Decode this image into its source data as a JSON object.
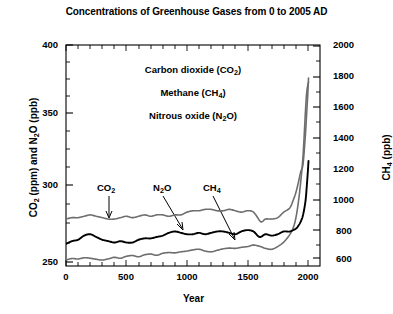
{
  "chart_data": {
    "type": "line",
    "title": "Concentrations of Greenhouse Gases from 0 to 2005 AD",
    "xlabel": "Year",
    "ylabel_left": "CO2 (ppm) and N2O (ppb)",
    "ylabel_right": "CH4 (ppb)",
    "xlim": [
      0,
      2100
    ],
    "ylim_left": [
      243,
      403
    ],
    "ylim_right": [
      560,
      2040
    ],
    "xticks": [
      0,
      500,
      1000,
      1500,
      2000
    ],
    "yticks_left": [
      250,
      300,
      350,
      400
    ],
    "yticks_right": [
      600,
      800,
      1000,
      1200,
      1400,
      1600,
      1800,
      2000
    ],
    "xtick_labels": [
      "0",
      "500",
      "1000",
      "1500",
      "2000"
    ],
    "ytick_labels_left": [
      "250",
      "300",
      "350",
      "400"
    ],
    "ytick_labels_right": [
      "600",
      "800",
      "1000",
      "1200",
      "1400",
      "1600",
      "1800",
      "2000"
    ],
    "grid": false,
    "legend_position": "inside-upper-center",
    "legend_entries": [
      "Carbon dioxide (CO2)",
      "Methane (CH4)",
      "Nitrous oxide (N2O)"
    ],
    "annotations": [
      {
        "text": "CO2",
        "axis": "left",
        "x": 330,
        "y": 299
      },
      {
        "text": "N2O",
        "axis": "left",
        "x": 780,
        "y": 299
      },
      {
        "text": "CH4",
        "axis": "right",
        "x": 1170,
        "y": 999
      }
    ],
    "series": [
      {
        "name": "Carbon dioxide (CO2)",
        "axis": "left",
        "unit": "ppm",
        "color": "#6e6e6e",
        "x": [
          0,
          50,
          100,
          150,
          200,
          250,
          300,
          350,
          400,
          450,
          500,
          550,
          600,
          650,
          700,
          750,
          800,
          850,
          900,
          950,
          1000,
          1050,
          1100,
          1150,
          1200,
          1250,
          1300,
          1350,
          1400,
          1450,
          1500,
          1550,
          1600,
          1620,
          1650,
          1700,
          1750,
          1800,
          1850,
          1880,
          1900,
          1920,
          1940,
          1960,
          1980,
          1990,
          2000,
          2005
        ],
        "values": [
          277,
          278,
          278,
          279,
          280,
          279,
          278,
          277,
          277,
          278,
          279,
          278,
          279,
          280,
          279,
          280,
          280,
          279,
          280,
          280,
          282,
          283,
          283,
          284,
          284,
          283,
          283,
          284,
          283,
          282,
          283,
          282,
          276,
          275,
          277,
          277,
          278,
          282,
          285,
          291,
          296,
          303,
          311,
          317,
          339,
          354,
          369,
          379
        ]
      },
      {
        "name": "Nitrous oxide (N2O)",
        "axis": "left",
        "unit": "ppb",
        "color": "#000000",
        "x": [
          0,
          50,
          100,
          150,
          200,
          250,
          300,
          350,
          400,
          450,
          500,
          550,
          600,
          650,
          700,
          750,
          800,
          850,
          900,
          950,
          1000,
          1050,
          1100,
          1150,
          1200,
          1250,
          1300,
          1350,
          1400,
          1450,
          1500,
          1550,
          1600,
          1650,
          1700,
          1750,
          1800,
          1850,
          1900,
          1920,
          1940,
          1960,
          1980,
          1990,
          2000,
          2005
        ],
        "values": [
          259,
          261,
          262,
          265,
          266,
          264,
          262,
          261,
          260,
          261,
          260,
          260,
          262,
          263,
          263,
          264,
          265,
          267,
          268,
          267,
          266,
          266,
          267,
          266,
          267,
          268,
          268,
          267,
          266,
          268,
          269,
          268,
          264,
          266,
          265,
          266,
          268,
          268,
          270,
          272,
          275,
          280,
          290,
          300,
          312,
          319
        ]
      },
      {
        "name": "Methane (CH4)",
        "axis": "right",
        "unit": "ppb",
        "color": "#6e6e6e",
        "x": [
          0,
          50,
          100,
          150,
          200,
          250,
          300,
          350,
          400,
          450,
          500,
          550,
          600,
          650,
          700,
          750,
          800,
          850,
          900,
          950,
          1000,
          1050,
          1100,
          1150,
          1200,
          1250,
          1300,
          1350,
          1400,
          1450,
          1500,
          1550,
          1600,
          1650,
          1700,
          1750,
          1800,
          1850,
          1880,
          1900,
          1920,
          1940,
          1960,
          1980,
          1990,
          2000,
          2005
        ],
        "values": [
          600,
          610,
          607,
          615,
          612,
          605,
          600,
          608,
          618,
          612,
          625,
          630,
          622,
          635,
          640,
          632,
          645,
          650,
          648,
          655,
          660,
          668,
          672,
          660,
          655,
          665,
          675,
          680,
          678,
          685,
          690,
          700,
          692,
          678,
          672,
          690,
          720,
          770,
          820,
          880,
          980,
          1120,
          1300,
          1600,
          1720,
          1775,
          1790
        ]
      }
    ]
  },
  "axes_geometry": {
    "plot_left_px": 66,
    "plot_right_px": 320,
    "plot_top_px": 45,
    "plot_bottom_px": 266
  }
}
